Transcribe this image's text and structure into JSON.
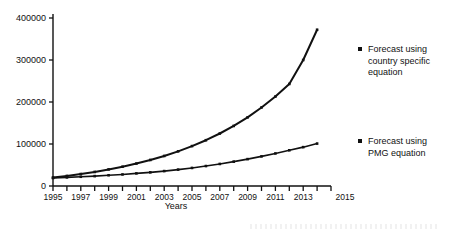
{
  "chart_data": {
    "type": "line",
    "title": "",
    "xlabel": "Years",
    "ylabel": "",
    "xlim": [
      1995,
      2015
    ],
    "ylim": [
      0,
      400000
    ],
    "grid": false,
    "legend_position": "right",
    "x_tick_labels": [
      "1995",
      "1997",
      "1999",
      "2001",
      "2003",
      "2005",
      "2007",
      "2009",
      "2011",
      "2013",
      "2015"
    ],
    "x_ticks": [
      1995,
      1997,
      1999,
      2001,
      2003,
      2005,
      2007,
      2009,
      2011,
      2013,
      2015
    ],
    "y_tick_labels": [
      "0",
      "100000",
      "200000",
      "300000",
      "400000"
    ],
    "y_ticks": [
      0,
      100000,
      200000,
      300000,
      400000
    ],
    "x": [
      1995,
      1996,
      1997,
      1998,
      1999,
      2000,
      2001,
      2002,
      2003,
      2004,
      2005,
      2006,
      2007,
      2008,
      2009,
      2010,
      2011,
      2012,
      2013,
      2014
    ],
    "series": [
      {
        "name": "Forecast using country specific equation",
        "marker": "square",
        "values": [
          20000,
          24000,
          28500,
          33500,
          39500,
          46000,
          53500,
          62000,
          71500,
          82500,
          95000,
          109000,
          125000,
          143000,
          163500,
          187000,
          213000,
          243000,
          300000,
          372000
        ]
      },
      {
        "name": "Forecast using PMG equation",
        "marker": "square",
        "values": [
          19000,
          20500,
          22000,
          23500,
          25500,
          27500,
          30000,
          32500,
          35500,
          39000,
          43000,
          47500,
          52500,
          58000,
          64000,
          70500,
          77500,
          85000,
          92500,
          101000
        ]
      }
    ]
  },
  "axis": {
    "x_title": "Years"
  },
  "legend": {
    "entries": [
      {
        "label": "Forecast using\ncountry specific\nequation",
        "marker_color": "#111111"
      },
      {
        "label": "Forecast using\nPMG equation",
        "marker_color": "#111111"
      }
    ]
  },
  "colors": {
    "line": "#111111",
    "axis": "#111111",
    "background": "#ffffff"
  }
}
